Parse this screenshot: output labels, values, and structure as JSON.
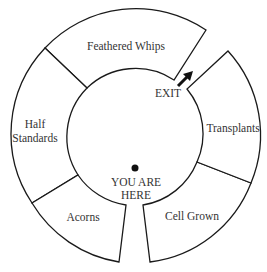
{
  "diagram": {
    "type": "ring-map",
    "sections": [
      {
        "id": "feathered-whips",
        "label": "Feathered Whips"
      },
      {
        "id": "half-standards",
        "label_lines": [
          "Half",
          "Standards"
        ]
      },
      {
        "id": "acorns",
        "label": "Acorns"
      },
      {
        "id": "cell-grown",
        "label": "Cell Grown"
      },
      {
        "id": "transplants",
        "label": "Transplants"
      }
    ],
    "exit": {
      "label": "EXIT",
      "icon": "arrow-up-right-icon"
    },
    "marker": {
      "label_lines": [
        "YOU ARE",
        "HERE"
      ],
      "icon": "dot-icon"
    },
    "colors": {
      "stroke": "#1a1a1a",
      "text": "#333333",
      "background": "#ffffff"
    }
  }
}
